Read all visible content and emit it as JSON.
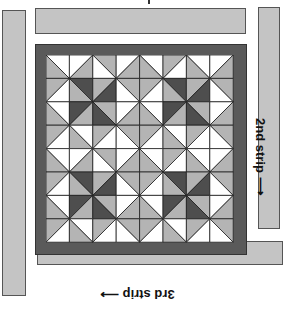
{
  "labels": {
    "second_strip": "2nd strip ⟶",
    "third_strip": "3rd strip ⟶"
  },
  "colors": {
    "strip_fill": "#c4c4c4",
    "border_fill": "#5a5a5a",
    "light": "#ffffff",
    "medium": "#b4b4b4",
    "dark": "#4e4e4e",
    "line": "#222222"
  },
  "quilt": {
    "rows": 8,
    "cols": 8,
    "cell_size": 23.4,
    "cells": [
      [
        "WG",
        "WG",
        "GW",
        "WG",
        "WG",
        "GW",
        "WG",
        "WG"
      ],
      [
        "GW",
        "DG",
        "GD",
        "GW",
        "GW",
        "DG",
        "GD",
        "GW"
      ],
      [
        "WG",
        "DG",
        "GD",
        "WG",
        "WG",
        "DG",
        "GD",
        "WG"
      ],
      [
        "GW",
        "WG",
        "GW",
        "GW",
        "GW",
        "WG",
        "GW",
        "GW"
      ],
      [
        "WG",
        "WG",
        "GW",
        "WG",
        "WG",
        "GW",
        "WG",
        "WG"
      ],
      [
        "GW",
        "DG",
        "GD",
        "GW",
        "GW",
        "DG",
        "GD",
        "GW"
      ],
      [
        "WG",
        "DG",
        "GD",
        "WG",
        "WG",
        "DG",
        "GD",
        "WG"
      ],
      [
        "GW",
        "WG",
        "GW",
        "GW",
        "GW",
        "WG",
        "GW",
        "GW"
      ]
    ]
  }
}
